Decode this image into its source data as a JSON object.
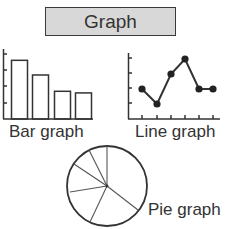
{
  "title": "Graph",
  "colors": {
    "stroke": "#333333",
    "title_bg": "#d8d8d8",
    "background": "#ffffff"
  },
  "labels": {
    "bar": "Bar graph",
    "line": "Line graph",
    "pie": "Pie graph"
  },
  "chart_data": [
    {
      "type": "bar",
      "title": "Bar graph",
      "categories": [
        "1",
        "2",
        "3",
        "4"
      ],
      "values": [
        3.6,
        2.7,
        1.7,
        1.6
      ],
      "xlabel": "",
      "ylabel": "",
      "ylim": [
        0,
        4.2
      ],
      "yticks": 4,
      "grid": false,
      "tick_labels_shown": false
    },
    {
      "type": "line",
      "title": "Line graph",
      "x": [
        1,
        2,
        3,
        4,
        5,
        6
      ],
      "values": [
        2,
        1,
        3,
        4,
        2,
        2
      ],
      "markers": true,
      "xlabel": "",
      "ylabel": "",
      "ylim": [
        0,
        4.3
      ],
      "yticks": 4,
      "xticks": 6,
      "grid": false,
      "tick_labels_shown": false
    },
    {
      "type": "pie",
      "title": "Pie graph",
      "slices_approx_pct": [
        36,
        15,
        14,
        11,
        10,
        8,
        6
      ],
      "labels_shown": false
    }
  ]
}
